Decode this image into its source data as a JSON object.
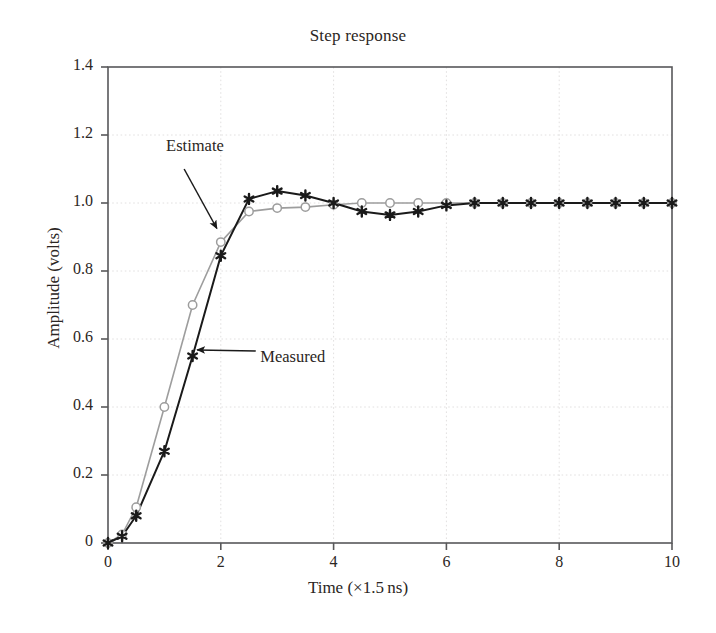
{
  "chart_data": {
    "type": "line",
    "title": "Step response",
    "xlabel": "Time (×1.5 ns)",
    "ylabel": "Amplitude (volts)",
    "xlim": [
      0,
      10
    ],
    "ylim": [
      0,
      1.4
    ],
    "grid": true,
    "grid_style": "dotted",
    "grid_color": "#e2e0e0",
    "frame_color": "#58585a",
    "legend": "none-inline-annotations",
    "xticks": [
      0,
      2,
      4,
      6,
      8,
      10
    ],
    "xtick_labels": [
      "0",
      "2",
      "4",
      "6",
      "8",
      "10"
    ],
    "yticks": [
      0,
      0.2,
      0.4,
      0.6,
      0.8,
      1.0,
      1.2,
      1.4
    ],
    "ytick_labels": [
      "0",
      "0.2",
      "0.4",
      "0.6",
      "0.8",
      "1.0",
      "1.2",
      "1.4"
    ],
    "x": [
      0,
      0.25,
      0.5,
      1.0,
      1.5,
      2.0,
      2.5,
      3.0,
      3.5,
      4.0,
      4.5,
      5.0,
      5.5,
      6.0,
      6.5,
      7.0,
      7.5,
      8.0,
      8.5,
      9.0,
      9.5,
      10.0
    ],
    "series": [
      {
        "name": "Measured",
        "color": "#1a1a1a",
        "marker": "six-pointed-asterisk",
        "marker_fill": "#1a1a1a",
        "linewidth": 2.0,
        "values": [
          0.0,
          0.02,
          0.08,
          0.27,
          0.55,
          0.845,
          1.012,
          1.035,
          1.022,
          1.0,
          0.975,
          0.965,
          0.975,
          0.993,
          1.0,
          1.0,
          1.0,
          1.0,
          1.0,
          1.0,
          1.0,
          1.0
        ]
      },
      {
        "name": "Estimate",
        "color": "#9d9d9d",
        "marker": "open-circle",
        "marker_fill": "#ffffff",
        "linewidth": 1.6,
        "values": [
          0.0,
          0.025,
          0.105,
          0.4,
          0.7,
          0.885,
          0.975,
          0.985,
          0.988,
          0.995,
          1.0,
          1.0,
          1.0,
          1.0,
          1.0,
          1.0,
          1.0,
          1.0,
          1.0,
          1.0,
          1.0,
          1.0
        ]
      }
    ],
    "annotations": [
      {
        "text": "Estimate",
        "label_x": 1.03,
        "label_y": 1.165,
        "arrow_from_x": 1.35,
        "arrow_from_y": 1.1,
        "arrow_to_x": 1.93,
        "arrow_to_y": 0.925
      },
      {
        "text": "Measured",
        "label_x": 2.7,
        "label_y": 0.545,
        "arrow_from_x": 2.62,
        "arrow_from_y": 0.565,
        "arrow_to_x": 1.58,
        "arrow_to_y": 0.568
      }
    ]
  }
}
